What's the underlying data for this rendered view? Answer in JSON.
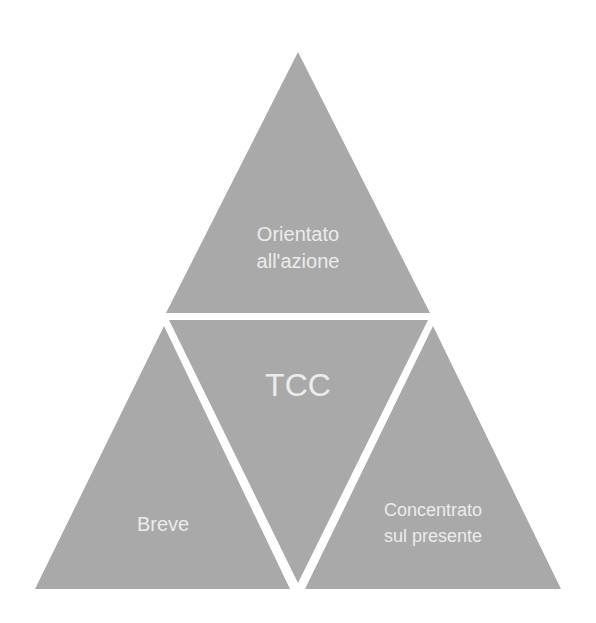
{
  "diagram": {
    "title": "TCC",
    "fill_color": "#a9a9a9",
    "text_color": "#ececec",
    "background": "#ffffff",
    "segments": {
      "top": {
        "line1": "Orientato",
        "line2": "all'azione"
      },
      "center": {
        "label": "TCC"
      },
      "left": {
        "label": "Breve"
      },
      "right": {
        "line1": "Concentrato",
        "line2": "sul presente"
      }
    }
  }
}
